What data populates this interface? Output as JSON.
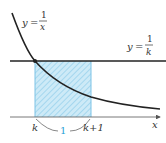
{
  "diagram": {
    "curve_label": {
      "lhs": "y",
      "eq": "=",
      "numerator": "1",
      "denominator": "x"
    },
    "line_label": {
      "lhs": "y",
      "eq": "=",
      "numerator": "1",
      "denominator": "k"
    },
    "x_axis_label": "x",
    "tick_left": "k",
    "tick_right": "k+1",
    "width_label": "1",
    "colors": {
      "curve": "#222222",
      "line": "#222222",
      "axis": "#555555",
      "rect_fill": "#cdeaf7",
      "hatch": "#7cc3e6",
      "width_label": "#2a9fd6"
    }
  }
}
